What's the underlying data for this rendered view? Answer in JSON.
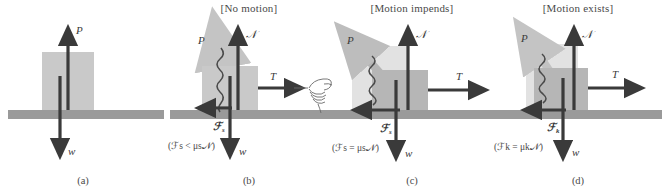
{
  "figure": {
    "colors": {
      "ground": "#9a9a9a",
      "block": "#c9c9c9",
      "block_light": "#dedede",
      "block_dark": "#b0b0b0",
      "arrow_dark": "#3a3a3a",
      "arrow_gray": "#c4c4c4",
      "text": "#4a4a4a",
      "background": "#ffffff"
    }
  },
  "panels": [
    {
      "id": "a",
      "caption": "(a)",
      "header": "",
      "formula": "",
      "labels": {
        "P": "P",
        "w": "w"
      },
      "vectors": [
        "P",
        "w"
      ]
    },
    {
      "id": "b",
      "caption": "(b)",
      "header": "[No motion]",
      "formula": "(ℱs < μs𝒩)",
      "formula_plain": "(Fs < μs N)",
      "labels": {
        "P": "P",
        "N": "𝒩",
        "T": "T",
        "w": "w",
        "F": "ℱs",
        "F_base": "ℱ",
        "F_sub": "s"
      },
      "vectors": [
        "P",
        "N",
        "T",
        "w",
        "Fs"
      ],
      "has_hand": true
    },
    {
      "id": "c",
      "caption": "(c)",
      "header": "[Motion impends]",
      "formula": "(ℱs = μs𝒩)",
      "formula_plain": "(Fs = μs N)",
      "labels": {
        "P": "P",
        "N": "𝒩",
        "T": "T",
        "w": "w",
        "F": "ℱs",
        "F_base": "ℱ",
        "F_sub": "s"
      },
      "vectors": [
        "P",
        "N",
        "T",
        "w",
        "Fs"
      ],
      "has_hand": false
    },
    {
      "id": "d",
      "caption": "(d)",
      "header": "[Motion exists]",
      "formula": "(ℱk = μk𝒩)",
      "formula_plain": "(Fk = μk N)",
      "labels": {
        "P": "P",
        "N": "𝒩",
        "T": "T",
        "w": "w",
        "F": "ℱk",
        "F_base": "ℱ",
        "F_sub": "k"
      },
      "vectors": [
        "P",
        "N",
        "T",
        "w",
        "Fk"
      ],
      "has_hand": false
    }
  ]
}
